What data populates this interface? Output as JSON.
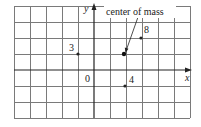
{
  "diagram": {
    "type": "coordinate-grid-point-masses",
    "grid": {
      "x_min": -5,
      "x_max": 6,
      "y_min": -3,
      "y_max": 4,
      "origin_px": [
        94,
        70
      ],
      "cell_px": 16,
      "line_color": "#7a7a7a",
      "axis_color": "#222222"
    },
    "axes": {
      "x_label": "x",
      "y_label": "y",
      "origin_label": "0"
    },
    "masses": [
      {
        "label": "3",
        "mass": 3,
        "x": -1,
        "y": 1
      },
      {
        "label": "8",
        "mass": 8,
        "x": 3,
        "y": 2
      },
      {
        "label": "4",
        "mass": 4,
        "x": 2,
        "y": -1
      }
    ],
    "center_of_mass": {
      "label": "center of mass",
      "x": 2,
      "y": 1
    }
  }
}
